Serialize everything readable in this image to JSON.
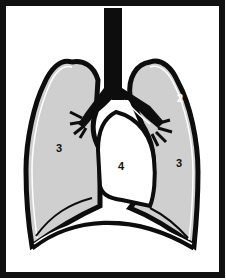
{
  "diagram": {
    "type": "anatomical-illustration",
    "colors": {
      "frame": "#111111",
      "outline": "#0d0d0d",
      "lung_fill": "#cfcfcf",
      "background": "#ffffff",
      "mediastinum_fill": "#ffffff"
    },
    "labels": [
      {
        "id": "label-2",
        "text": "2",
        "region": "pleura (right side outer lining)"
      },
      {
        "id": "label-3-left",
        "text": "3",
        "region": "left lung"
      },
      {
        "id": "label-3-right",
        "text": "3",
        "region": "right lung"
      },
      {
        "id": "label-4",
        "text": "4",
        "region": "mediastinum / heart space"
      }
    ]
  }
}
